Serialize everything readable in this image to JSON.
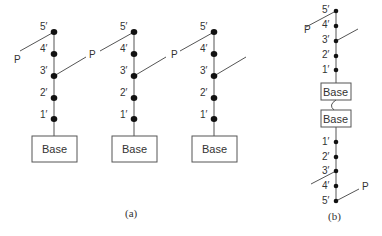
{
  "figure": {
    "panel_a": {
      "caption": "(a)",
      "columns": [
        {
          "nodes": [
            "5′",
            "4′",
            "3′",
            "2′",
            "1′"
          ],
          "base_label": "Base",
          "forces": [
            {
              "label": "P",
              "at": "5′",
              "direction": "down-left"
            },
            {
              "label": "P",
              "at": "3′",
              "direction": "up-right"
            }
          ]
        },
        {
          "nodes": [
            "5′",
            "4′",
            "3′",
            "2′",
            "1′"
          ],
          "base_label": "Base",
          "forces": [
            {
              "label": "",
              "at": "5′",
              "direction": "down-left"
            },
            {
              "label": "",
              "at": "3′",
              "direction": "up-right"
            }
          ]
        },
        {
          "nodes": [
            "5′",
            "4′",
            "3′",
            "2′",
            "1′"
          ],
          "base_label": "Base",
          "forces": [
            {
              "label": "P",
              "at": "5′",
              "direction": "down-left"
            },
            {
              "label": "",
              "at": "3′",
              "direction": "up-right"
            }
          ]
        }
      ]
    },
    "panel_b": {
      "caption": "(b)",
      "top_nodes": [
        "5′",
        "4′",
        "3′",
        "2′",
        "1′"
      ],
      "base_top": "Base",
      "base_bottom": "Base",
      "bottom_nodes": [
        "1′",
        "2′",
        "3′",
        "4′",
        "5′"
      ],
      "force_labels": [
        "P",
        "P"
      ]
    }
  }
}
